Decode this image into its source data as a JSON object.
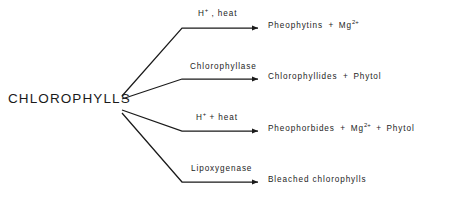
{
  "diagram": {
    "type": "reaction-branching-diagram",
    "background_color": "#ffffff",
    "line_color": "#1a1a1a",
    "text_color": "#1d1d1d",
    "root": {
      "label": "CHLOROPHYLLS"
    },
    "branches": [
      {
        "id": "branch-pheophytins",
        "condition": {
          "text": "H+ , heat",
          "base": "H",
          "superscript": "+",
          "rest": " , heat"
        },
        "product": {
          "text": "Pheophytins  +  Mg2+",
          "parts": [
            {
              "kind": "text",
              "value": "Pheophytins"
            },
            {
              "kind": "plus",
              "value": "+"
            },
            {
              "kind": "formula",
              "base": "Mg",
              "superscript": "2+"
            }
          ]
        }
      },
      {
        "id": "branch-chlorophyllides",
        "condition": {
          "text": "Chlorophyllase",
          "base": "Chlorophyllase",
          "superscript": "",
          "rest": ""
        },
        "product": {
          "text": "Chlorophyllides  +  Phytol",
          "parts": [
            {
              "kind": "text",
              "value": "Chlorophyllides"
            },
            {
              "kind": "plus",
              "value": "+"
            },
            {
              "kind": "text",
              "value": "Phytol"
            }
          ]
        }
      },
      {
        "id": "branch-pheophorbides",
        "condition": {
          "text": "H+ + heat",
          "base": "H",
          "superscript": "+",
          "rest": " + heat"
        },
        "product": {
          "text": "Pheophorbides  +  Mg2+  +  Phytol",
          "parts": [
            {
              "kind": "text",
              "value": "Pheophorbides"
            },
            {
              "kind": "plus",
              "value": "+"
            },
            {
              "kind": "formula",
              "base": "Mg",
              "superscript": "2+"
            },
            {
              "kind": "plus",
              "value": "+"
            },
            {
              "kind": "text",
              "value": "Phytol"
            }
          ]
        }
      },
      {
        "id": "branch-bleached",
        "condition": {
          "text": "Lipoxygenase",
          "base": "Lipoxygenase",
          "superscript": "",
          "rest": ""
        },
        "product": {
          "text": "Bleached chlorophylls",
          "parts": [
            {
              "kind": "text",
              "value": "Bleached chlorophylls"
            }
          ]
        }
      }
    ]
  }
}
